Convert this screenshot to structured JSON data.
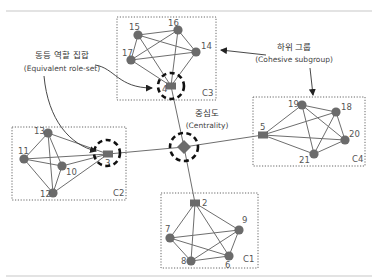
{
  "diagram": {
    "clusters": [
      {
        "id": "C1",
        "label": "C1",
        "box": {
          "x": 161,
          "y": 193,
          "w": 97,
          "h": 75
        },
        "label_pos": {
          "x": 243,
          "y": 262
        }
      },
      {
        "id": "C2",
        "label": "C2",
        "box": {
          "x": 12,
          "y": 127,
          "w": 114,
          "h": 73
        },
        "label_pos": {
          "x": 113,
          "y": 196
        }
      },
      {
        "id": "C3",
        "label": "C3",
        "box": {
          "x": 117,
          "y": 17,
          "w": 99,
          "h": 83
        },
        "label_pos": {
          "x": 202,
          "y": 96
        }
      },
      {
        "id": "C4",
        "label": "C4",
        "box": {
          "x": 253,
          "y": 97,
          "w": 112,
          "h": 69
        },
        "label_pos": {
          "x": 352,
          "y": 162
        }
      }
    ],
    "nodes": [
      {
        "id": "2",
        "label": "2",
        "cluster": "C1",
        "shape": "square",
        "x": 195,
        "y": 203,
        "lx": 202,
        "ly": 206
      },
      {
        "id": "9",
        "label": "9",
        "cluster": "C1",
        "shape": "circle",
        "x": 239,
        "y": 230,
        "lx": 242,
        "ly": 223
      },
      {
        "id": "7",
        "label": "7",
        "cluster": "C1",
        "shape": "circle",
        "x": 170,
        "y": 238,
        "lx": 165,
        "ly": 232
      },
      {
        "id": "8",
        "label": "8",
        "cluster": "C1",
        "shape": "circle",
        "x": 191,
        "y": 261,
        "lx": 181,
        "ly": 264
      },
      {
        "id": "6",
        "label": "6",
        "cluster": "C1",
        "shape": "circle",
        "x": 229,
        "y": 256,
        "lx": 225,
        "ly": 268
      },
      {
        "id": "13",
        "label": "13",
        "cluster": "C2",
        "shape": "circle",
        "x": 48,
        "y": 133,
        "lx": 34,
        "ly": 134
      },
      {
        "id": "11",
        "label": "11",
        "cluster": "C2",
        "shape": "circle",
        "x": 24,
        "y": 159,
        "lx": 18,
        "ly": 154
      },
      {
        "id": "10",
        "label": "10",
        "cluster": "C2",
        "shape": "circle",
        "x": 62,
        "y": 166,
        "lx": 66,
        "ly": 175
      },
      {
        "id": "12",
        "label": "12",
        "cluster": "C2",
        "shape": "circle",
        "x": 53,
        "y": 193,
        "lx": 40,
        "ly": 197
      },
      {
        "id": "3",
        "label": "3",
        "cluster": "C2",
        "shape": "square",
        "x": 108,
        "y": 154,
        "lx": 105,
        "ly": 166
      },
      {
        "id": "15",
        "label": "15",
        "cluster": "C3",
        "shape": "circle",
        "x": 138,
        "y": 35,
        "lx": 129,
        "ly": 30
      },
      {
        "id": "16",
        "label": "16",
        "cluster": "C3",
        "shape": "circle",
        "x": 178,
        "y": 30,
        "lx": 168,
        "ly": 26
      },
      {
        "id": "14",
        "label": "14",
        "cluster": "C3",
        "shape": "circle",
        "x": 196,
        "y": 52,
        "lx": 201,
        "ly": 49
      },
      {
        "id": "17",
        "label": "17",
        "cluster": "C3",
        "shape": "circle",
        "x": 131,
        "y": 60,
        "lx": 122,
        "ly": 56
      },
      {
        "id": "4",
        "label": "4",
        "cluster": "C3",
        "shape": "square",
        "x": 171,
        "y": 86,
        "lx": 162,
        "ly": 92
      },
      {
        "id": "5",
        "label": "5",
        "cluster": "C4",
        "shape": "square",
        "x": 263,
        "y": 135,
        "lx": 260,
        "ly": 130
      },
      {
        "id": "19",
        "label": "19",
        "cluster": "C4",
        "shape": "circle",
        "x": 302,
        "y": 105,
        "lx": 288,
        "ly": 107
      },
      {
        "id": "18",
        "label": "18",
        "cluster": "C4",
        "shape": "circle",
        "x": 336,
        "y": 112,
        "lx": 341,
        "ly": 110
      },
      {
        "id": "20",
        "label": "20",
        "cluster": "C4",
        "shape": "circle",
        "x": 345,
        "y": 140,
        "lx": 349,
        "ly": 137
      },
      {
        "id": "21",
        "label": "21",
        "cluster": "C4",
        "shape": "circle",
        "x": 314,
        "y": 154,
        "lx": 299,
        "ly": 163
      },
      {
        "id": "center",
        "label": "",
        "cluster": null,
        "shape": "diamond",
        "x": 184,
        "y": 147
      }
    ],
    "edges": [
      [
        "2",
        "9"
      ],
      [
        "2",
        "7"
      ],
      [
        "2",
        "8"
      ],
      [
        "2",
        "6"
      ],
      [
        "9",
        "7"
      ],
      [
        "9",
        "8"
      ],
      [
        "9",
        "6"
      ],
      [
        "7",
        "8"
      ],
      [
        "7",
        "6"
      ],
      [
        "8",
        "6"
      ],
      [
        "13",
        "11"
      ],
      [
        "13",
        "10"
      ],
      [
        "13",
        "12"
      ],
      [
        "13",
        "3"
      ],
      [
        "11",
        "10"
      ],
      [
        "11",
        "12"
      ],
      [
        "11",
        "3"
      ],
      [
        "10",
        "12"
      ],
      [
        "10",
        "3"
      ],
      [
        "12",
        "3"
      ],
      [
        "15",
        "16"
      ],
      [
        "15",
        "14"
      ],
      [
        "15",
        "17"
      ],
      [
        "15",
        "4"
      ],
      [
        "16",
        "14"
      ],
      [
        "16",
        "17"
      ],
      [
        "16",
        "4"
      ],
      [
        "14",
        "17"
      ],
      [
        "14",
        "4"
      ],
      [
        "17",
        "4"
      ],
      [
        "5",
        "19"
      ],
      [
        "5",
        "18"
      ],
      [
        "5",
        "20"
      ],
      [
        "5",
        "21"
      ],
      [
        "19",
        "18"
      ],
      [
        "19",
        "20"
      ],
      [
        "19",
        "21"
      ],
      [
        "18",
        "20"
      ],
      [
        "18",
        "21"
      ],
      [
        "20",
        "21"
      ],
      [
        "center",
        "2"
      ],
      [
        "center",
        "3"
      ],
      [
        "center",
        "4"
      ],
      [
        "center",
        "5"
      ]
    ],
    "highlights": [
      {
        "target": "4",
        "label": "equivalent-role-node-4",
        "x": 171,
        "y": 86,
        "r": 13
      },
      {
        "target": "3",
        "label": "equivalent-role-node-3",
        "x": 107,
        "y": 153,
        "r": 13
      },
      {
        "target": "center",
        "label": "centrality-node",
        "x": 184,
        "y": 147,
        "r": 14
      }
    ],
    "annotations": {
      "equivalent_role_set": {
        "ko": "동등 역할 집합",
        "en": "(Equivalent role-set)",
        "x": 62,
        "y_ko": 58,
        "y_en": 71
      },
      "cohesive_subgroup": {
        "ko": "하위 그룹",
        "en": "(Cohesive subgroup)",
        "x": 294,
        "y_ko": 50,
        "y_en": 62
      },
      "centrality": {
        "ko": "중심도",
        "en": "(Centrality)",
        "x": 207,
        "y_ko": 116,
        "y_en": 127
      }
    },
    "colors": {
      "node": "#6b6b6b",
      "edge": "#6e6e6e",
      "highlight": "#111111",
      "box": "#666666",
      "rule": "#c8c8c8"
    }
  }
}
